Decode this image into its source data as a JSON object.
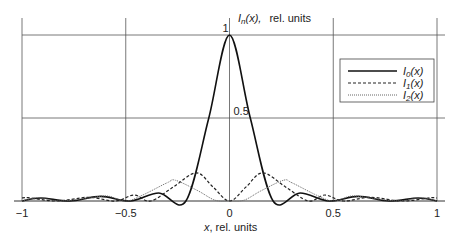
{
  "chart_data": {
    "type": "line",
    "title": "",
    "ylabel": "I_n(x), rel. units",
    "ylabel_parts": {
      "main": "I",
      "sub": "n",
      "rest": "(x),",
      "units": "rel. units"
    },
    "xlabel": "x, rel. units",
    "xlabel_parts": {
      "var": "x",
      "rest": ", rel. units"
    },
    "xlim": [
      -1,
      1
    ],
    "ylim": [
      0,
      1
    ],
    "x_ticks": [
      "-1",
      "-0.5",
      "0",
      "0.5",
      "1"
    ],
    "x_tick_labels": [
      "−1",
      "−0.5",
      "0",
      "0.5",
      "1"
    ],
    "y_ticks": [
      "0.5",
      "1"
    ],
    "grid": true,
    "legend_position": "upper right",
    "series": [
      {
        "name": "I0(x)",
        "label_main": "I",
        "label_sub": "0",
        "label_rest": "(x)",
        "style": "solid",
        "x": [
          -1,
          -0.91,
          -0.77,
          -0.62,
          -0.48,
          -0.34,
          -0.21,
          -0.1,
          0,
          0.1,
          0.21,
          0.34,
          0.48,
          0.62,
          0.77,
          0.91,
          1
        ],
        "values": [
          0,
          0.018,
          0,
          0.028,
          0,
          0.048,
          0,
          0.5,
          1,
          0.5,
          0,
          0.048,
          0,
          0.028,
          0,
          0.018,
          0
        ]
      },
      {
        "name": "I1(x)",
        "label_main": "I",
        "label_sub": "1",
        "label_rest": "(x)",
        "style": "dashed",
        "x": [
          -1,
          -0.97,
          -0.83,
          -0.68,
          -0.55,
          -0.46,
          -0.38,
          -0.27,
          -0.16,
          -0.08,
          0,
          0.08,
          0.16,
          0.27,
          0.38,
          0.46,
          0.55,
          0.68,
          0.83,
          0.97,
          1
        ],
        "values": [
          0.018,
          0.02,
          0,
          0.022,
          0,
          0.036,
          0,
          0.085,
          0.17,
          0.085,
          0,
          0.085,
          0.17,
          0.085,
          0,
          0.036,
          0,
          0.022,
          0,
          0.02,
          0.018
        ]
      },
      {
        "name": "I2(x)",
        "label_main": "I",
        "label_sub": "2",
        "label_rest": "(x)",
        "style": "dotted",
        "x": [
          -1,
          -0.92,
          -0.82,
          -0.69,
          -0.59,
          -0.5,
          -0.42,
          -0.3,
          -0.26,
          -0.15,
          -0.07,
          0,
          0.07,
          0.15,
          0.26,
          0.3,
          0.42,
          0.5,
          0.59,
          0.69,
          0.82,
          0.92,
          1
        ],
        "values": [
          0,
          0.02,
          0,
          0.016,
          0.03,
          0,
          0.035,
          0.11,
          0.125,
          0.06,
          0.005,
          0,
          0.005,
          0.06,
          0.125,
          0.11,
          0.035,
          0,
          0.03,
          0.016,
          0,
          0.02,
          0
        ]
      }
    ]
  }
}
